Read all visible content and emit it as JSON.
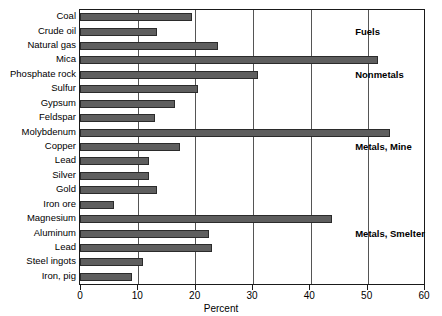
{
  "chart_data": {
    "type": "bar",
    "orientation": "horizontal",
    "title": "",
    "xlabel": "Percent",
    "ylabel": "",
    "xlim": [
      0,
      60
    ],
    "xticks": [
      0,
      10,
      20,
      30,
      40,
      50,
      60
    ],
    "xtick_labels": [
      "0",
      "10",
      "20",
      "30",
      "40",
      "50",
      "60"
    ],
    "grid": true,
    "grid_axis": "x",
    "legend": "none",
    "bar_color": "#5e5e5e",
    "bar_edge_color": "#2b2b2b",
    "categories": [
      "Coal",
      "Crude oil",
      "Natural gas",
      "Mica",
      "Phosphate rock",
      "Sulfur",
      "Gypsum",
      "Feldspar",
      "Molybdenum",
      "Copper",
      "Lead",
      "Silver",
      "Gold",
      "Iron ore",
      "Magnesium",
      "Aluminum",
      "Lead",
      "Steel ingots",
      "Iron, pig"
    ],
    "values": [
      19.5,
      13.5,
      24,
      52,
      31,
      20.5,
      16.5,
      13,
      54,
      17.5,
      12,
      12,
      13.5,
      6,
      44,
      22.5,
      23,
      11,
      9
    ],
    "annotations": [
      {
        "text": "Fuels",
        "value_x": 48,
        "category_index": 1
      },
      {
        "text": "Nonmetals",
        "value_x": 48,
        "category_index": 4
      },
      {
        "text": "Metals, Mine",
        "value_x": 48,
        "category_index": 9
      },
      {
        "text": "Metals, Smelter",
        "value_x": 48,
        "category_index": 15
      }
    ]
  }
}
